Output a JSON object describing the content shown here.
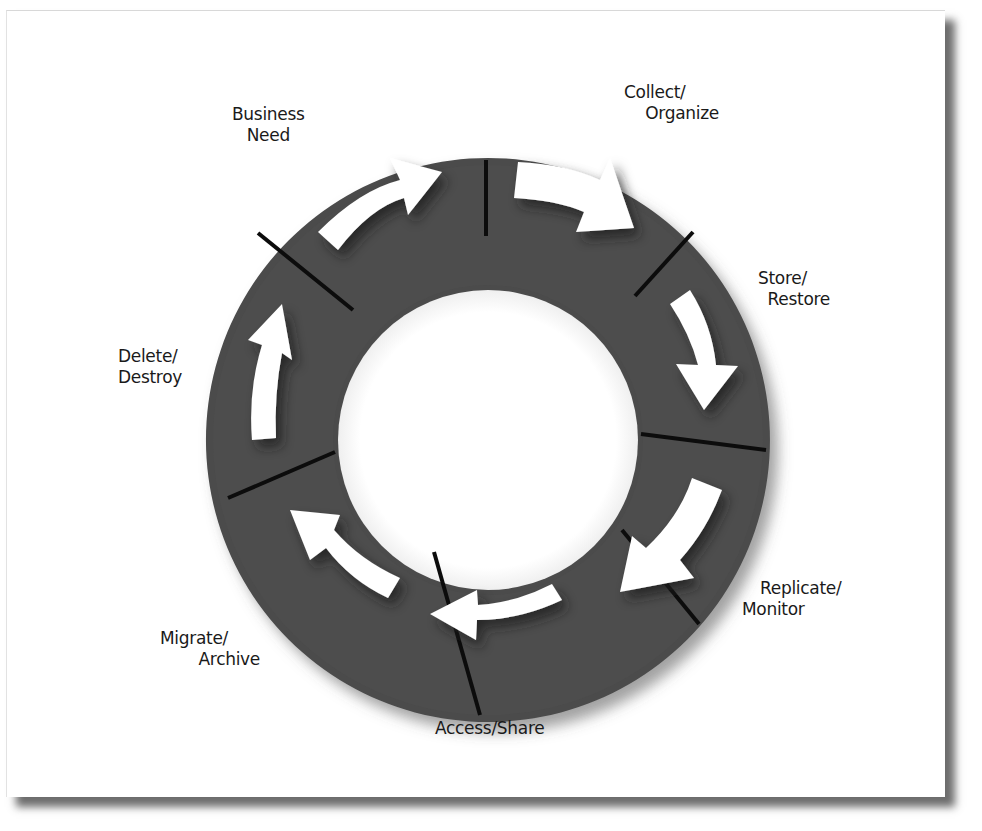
{
  "diagram": {
    "type": "cycle",
    "title": "",
    "ring": {
      "fill_color": "#4a4a4a",
      "divider_color": "#0c0c0c",
      "arrow_color": "#ffffff",
      "center_color": "#ffffff"
    },
    "stages": [
      {
        "id": "business-need",
        "line1": "Business",
        "line2": "Need"
      },
      {
        "id": "collect-organize",
        "line1": "Collect/",
        "line2": "Organize"
      },
      {
        "id": "store-restore",
        "line1": "Store/",
        "line2": "Restore"
      },
      {
        "id": "replicate-monitor",
        "line1": "Replicate/",
        "line2": "Monitor"
      },
      {
        "id": "access-share",
        "line1": "Access/Share",
        "line2": ""
      },
      {
        "id": "migrate-archive",
        "line1": "Migrate/",
        "line2": "Archive"
      },
      {
        "id": "delete-destroy",
        "line1": "Delete/",
        "line2": "Destroy"
      }
    ],
    "direction": "clockwise"
  }
}
